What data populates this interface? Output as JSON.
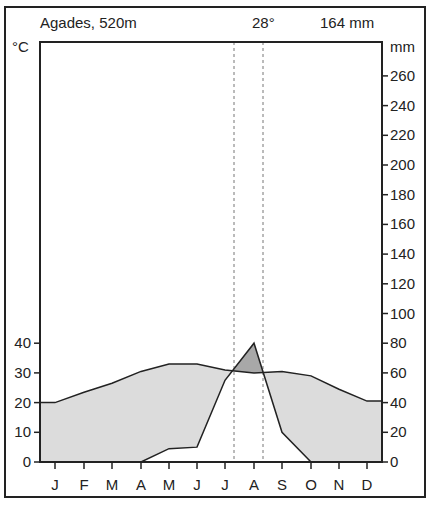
{
  "chart_data": {
    "type": "climate-diagram",
    "title": "Agades, 520m",
    "station": "Agades",
    "elevation": "520m",
    "mean_annual_temperature_label": "28°",
    "annual_precipitation_label": "164 mm",
    "left_axis_label": "°C",
    "right_axis_label": "mm",
    "categories": [
      "J",
      "F",
      "M",
      "A",
      "M",
      "J",
      "J",
      "A",
      "S",
      "O",
      "N",
      "D"
    ],
    "series": [
      {
        "name": "Temperature (°C)",
        "axis": "left",
        "values": [
          20,
          23.5,
          26.5,
          30.5,
          33,
          33,
          31,
          30,
          30.5,
          29,
          24.5,
          20.5
        ]
      },
      {
        "name": "Precipitation (mm)",
        "axis": "right",
        "values": [
          0,
          0,
          0,
          0,
          9,
          10,
          55,
          80,
          20,
          0,
          0,
          0
        ]
      }
    ],
    "left_ticks": [
      "0",
      "10",
      "20",
      "30",
      "40"
    ],
    "right_ticks": [
      "0",
      "20",
      "40",
      "60",
      "80",
      "100",
      "120",
      "140",
      "160",
      "180",
      "200",
      "220",
      "240",
      "260"
    ],
    "left_ylim": [
      0,
      130
    ],
    "right_ylim": [
      0,
      260
    ],
    "scale_note": "10 °C = 20 mm",
    "dashed_lines_months": [
      "J",
      "A"
    ],
    "grid": false,
    "legend": "none"
  }
}
